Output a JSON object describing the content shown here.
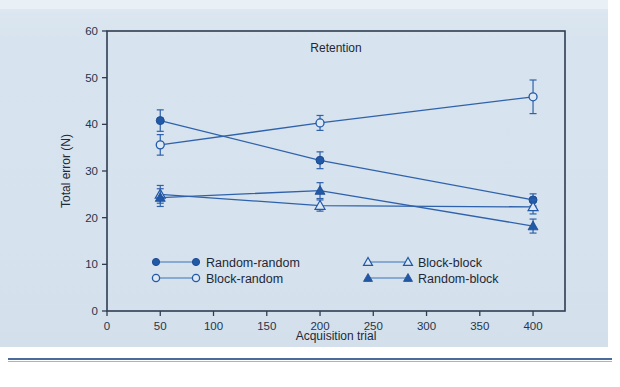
{
  "figure": {
    "background_color": "#d7e3ee",
    "frame_color": "#2f3d52",
    "series_color": "#2159a8",
    "rule_color": "#4a6c9b"
  },
  "chart_data": {
    "type": "line",
    "title": "",
    "annotation": "Retention",
    "xlabel": "Acquisition trial",
    "ylabel": "Total error (N)",
    "xlim": [
      0,
      430
    ],
    "ylim": [
      0,
      60
    ],
    "xticks": [
      0,
      50,
      100,
      150,
      200,
      250,
      300,
      350,
      400
    ],
    "yticks": [
      0,
      10,
      20,
      30,
      40,
      50,
      60
    ],
    "xtick_labels": [
      "0",
      "50",
      "100",
      "150",
      "200",
      "250",
      "300",
      "350",
      "400"
    ],
    "ytick_labels": [
      "0",
      "10",
      "20",
      "30",
      "40",
      "50",
      "60"
    ],
    "grid": false,
    "legend_position": "inside-lower-left",
    "x": [
      50,
      200,
      400
    ],
    "series": [
      {
        "name": "Random-random",
        "marker": "filled-circle",
        "values": [
          40.8,
          32.3,
          23.8
        ],
        "errors": [
          2.3,
          1.8,
          1.3
        ]
      },
      {
        "name": "Block-random",
        "marker": "open-circle",
        "values": [
          35.6,
          40.3,
          45.9
        ],
        "errors": [
          2.2,
          1.6,
          3.6
        ]
      },
      {
        "name": "Block-block",
        "marker": "open-triangle",
        "values": [
          25.0,
          22.6,
          22.3
        ],
        "errors": [
          1.9,
          1.2,
          1.5
        ]
      },
      {
        "name": "Random-block",
        "marker": "filled-triangle",
        "values": [
          24.3,
          25.8,
          18.2
        ],
        "errors": [
          1.9,
          1.7,
          1.5
        ]
      }
    ]
  },
  "legend": {
    "entries": [
      {
        "label": "Random-random",
        "marker": "filled-circle"
      },
      {
        "label": "Block-random",
        "marker": "open-circle"
      },
      {
        "label": "Block-block",
        "marker": "open-triangle"
      },
      {
        "label": "Random-block",
        "marker": "filled-triangle"
      }
    ]
  }
}
